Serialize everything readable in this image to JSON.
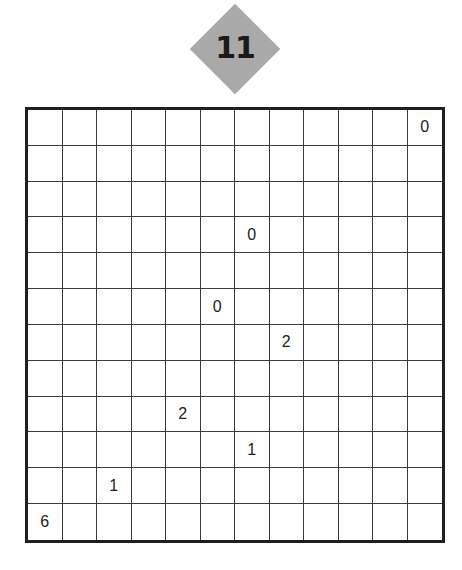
{
  "puzzle": {
    "number": "11",
    "rows": 12,
    "cols": 12,
    "clues": [
      {
        "row": 0,
        "col": 11,
        "value": "0"
      },
      {
        "row": 3,
        "col": 6,
        "value": "0"
      },
      {
        "row": 5,
        "col": 5,
        "value": "0"
      },
      {
        "row": 6,
        "col": 7,
        "value": "2"
      },
      {
        "row": 8,
        "col": 4,
        "value": "2"
      },
      {
        "row": 9,
        "col": 6,
        "value": "1"
      },
      {
        "row": 10,
        "col": 2,
        "value": "1"
      },
      {
        "row": 11,
        "col": 0,
        "value": "6"
      }
    ]
  },
  "colors": {
    "badge": "#a9a9a9",
    "badge_text": "#1a1a1a",
    "grid_line": "#3a3a3a",
    "grid_border": "#1f1f1f",
    "clue_text": "#222222"
  }
}
